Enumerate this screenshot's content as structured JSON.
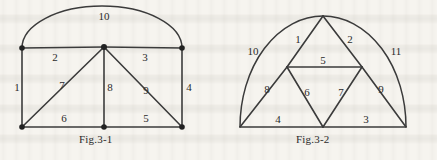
{
  "page": {
    "background_color": "#f6f4ef",
    "ink_color": "#3b3b3b",
    "width": 437,
    "height": 160
  },
  "figures": [
    {
      "id": "fig-3-1",
      "caption": "Fig.3-1",
      "description": "Graph with five vertices and ten numbered edges including an outer arc",
      "edge_labels": [
        {
          "id": "e1",
          "label": "1",
          "x": 17,
          "y": 88
        },
        {
          "id": "e2",
          "label": "2",
          "x": 55,
          "y": 58
        },
        {
          "id": "e3",
          "label": "3",
          "x": 145,
          "y": 58
        },
        {
          "id": "e4",
          "label": "4",
          "x": 189,
          "y": 88
        },
        {
          "id": "e5",
          "label": "5",
          "x": 146,
          "y": 119
        },
        {
          "id": "e6",
          "label": "6",
          "x": 64,
          "y": 119
        },
        {
          "id": "e7",
          "label": "7",
          "x": 62,
          "y": 86
        },
        {
          "id": "e8",
          "label": "8",
          "x": 110,
          "y": 88
        },
        {
          "id": "e9",
          "label": "9",
          "x": 146,
          "y": 91
        },
        {
          "id": "e10",
          "label": "10",
          "x": 104,
          "y": 17
        }
      ]
    },
    {
      "id": "fig-3-2",
      "caption": "Fig.3-2",
      "description": "Graph with a semicircular arc over nested triangles and eleven numbered edges",
      "edge_labels": [
        {
          "id": "e1",
          "label": "1",
          "x": 298,
          "y": 40
        },
        {
          "id": "e2",
          "label": "2",
          "x": 350,
          "y": 40
        },
        {
          "id": "e3",
          "label": "3",
          "x": 366,
          "y": 120
        },
        {
          "id": "e4",
          "label": "4",
          "x": 278,
          "y": 120
        },
        {
          "id": "e5",
          "label": "5",
          "x": 323,
          "y": 61
        },
        {
          "id": "e6",
          "label": "6",
          "x": 307,
          "y": 93
        },
        {
          "id": "e7",
          "label": "7",
          "x": 341,
          "y": 93
        },
        {
          "id": "e8",
          "label": "8",
          "x": 267,
          "y": 90
        },
        {
          "id": "e9",
          "label": "9",
          "x": 381,
          "y": 90
        },
        {
          "id": "e10",
          "label": "10",
          "x": 253,
          "y": 52
        },
        {
          "id": "e11",
          "label": "11",
          "x": 396,
          "y": 52
        }
      ]
    }
  ],
  "captions": {
    "fig1": "Fig.3-1",
    "fig2": "Fig.3-2"
  }
}
